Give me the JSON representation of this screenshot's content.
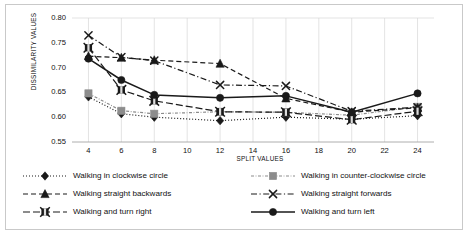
{
  "chart_data": {
    "type": "line",
    "title": "",
    "xlabel": "SPLIT VALUES",
    "ylabel": "DISSIMILARITY VALUES",
    "x": [
      4,
      6,
      8,
      12,
      16,
      20,
      24
    ],
    "xlim": [
      3,
      25
    ],
    "ylim": [
      0.55,
      0.8
    ],
    "xticks": [
      "4",
      "6",
      "8",
      "10",
      "12",
      "14",
      "16",
      "18",
      "20",
      "22",
      "24"
    ],
    "xtick_values": [
      4,
      6,
      8,
      10,
      12,
      14,
      16,
      18,
      20,
      22,
      24
    ],
    "yticks": [
      "0.55",
      "0.60",
      "0.65",
      "0.70",
      "0.75",
      "0.80"
    ],
    "ytick_values": [
      0.55,
      0.6,
      0.65,
      0.7,
      0.75,
      0.8
    ],
    "grid": "vertical",
    "legend_position": "bottom",
    "series": [
      {
        "name": "Walking in clockwise circle",
        "values": [
          0.641,
          0.607,
          0.6,
          0.593,
          0.6,
          0.596,
          0.603
        ],
        "color": "#1a1a1a",
        "marker": "diamond",
        "dash": "dotted"
      },
      {
        "name": "Walking in counter-clockwise circle",
        "values": [
          0.648,
          0.613,
          0.607,
          0.611,
          0.61,
          0.604,
          0.621
        ],
        "color": "#8c8c8c",
        "marker": "square",
        "dash": "dashdot-fine"
      },
      {
        "name": "Walking straight backwards",
        "values": [
          0.723,
          0.72,
          0.715,
          0.708,
          0.638,
          0.61,
          0.619
        ],
        "color": "#1a1a1a",
        "marker": "triangle",
        "dash": "dashed"
      },
      {
        "name": "Walking straight forwards",
        "values": [
          0.765,
          0.721,
          0.714,
          0.665,
          0.663,
          0.612,
          0.62
        ],
        "color": "#1a1a1a",
        "marker": "x",
        "dash": "dashdot"
      },
      {
        "name": "Walking and turn right",
        "values": [
          0.74,
          0.655,
          0.633,
          0.611,
          0.61,
          0.595,
          0.612
        ],
        "color": "#1a1a1a",
        "marker": "x-box",
        "dash": "longdash"
      },
      {
        "name": "Walking and turn left",
        "values": [
          0.718,
          0.675,
          0.645,
          0.639,
          0.643,
          0.61,
          0.648
        ],
        "color": "#1a1a1a",
        "marker": "circle",
        "dash": "solid"
      }
    ]
  },
  "legend": {
    "items": [
      {
        "label": "Walking in clockwise circle"
      },
      {
        "label": "Walking in counter-clockwise circle"
      },
      {
        "label": "Walking straight backwards"
      },
      {
        "label": "Walking straight forwards"
      },
      {
        "label": "Walking and turn right"
      },
      {
        "label": "Walking and turn left"
      }
    ]
  }
}
